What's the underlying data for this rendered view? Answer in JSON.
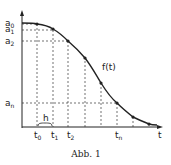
{
  "figure": {
    "caption": "Abb. 1",
    "curve_label": "f(t)",
    "x_axis_label": "t",
    "step_label": "h",
    "y_labels": [
      {
        "base": "a",
        "sub": "0"
      },
      {
        "base": "a",
        "sub": "1"
      },
      {
        "base": "a",
        "sub": "2"
      },
      {
        "base": "a",
        "sub": "n"
      }
    ],
    "x_labels": [
      {
        "base": "t",
        "sub": "0"
      },
      {
        "base": "t",
        "sub": "1"
      },
      {
        "base": "t",
        "sub": "2"
      },
      {
        "base": "t",
        "sub": "n"
      }
    ],
    "colors": {
      "line": "#222222",
      "background": "#ffffff"
    }
  }
}
